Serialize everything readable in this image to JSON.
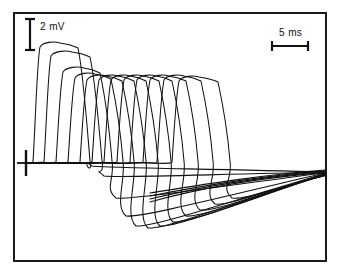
{
  "figure": {
    "type": "electrophysiology-trace-overlay",
    "background_color": "#ffffff",
    "trace_color": "#111111",
    "frame_color": "#1a1a1a"
  },
  "scale_bars": {
    "vertical": {
      "label": "2 mV",
      "value": 2,
      "unit": "mV",
      "pixel_length": 31,
      "x": 30,
      "y_top": 19,
      "y_bottom": 50
    },
    "horizontal": {
      "label": "5 ms",
      "value": 5,
      "unit": "ms",
      "pixel_length": 36,
      "y": 46,
      "x_left": 272,
      "x_right": 308
    }
  },
  "baseline_marker": {
    "name": "baseline-cross-marker",
    "x": 26,
    "y": 163,
    "h_half": 9,
    "v_half": 13
  },
  "chart_data": {
    "type": "line",
    "title": "",
    "xlabel": "",
    "ylabel": "",
    "grid": false,
    "legend": false,
    "x_unit": "ms",
    "y_unit": "mV",
    "baseline_y_px": 163,
    "x_axis_px": [
      26,
      325
    ],
    "y_axis_px": [
      14,
      260
    ],
    "px_per_ms": 7.2,
    "px_per_mV": 15.5,
    "n_traces": 12,
    "series": [
      {
        "name": "trace-1",
        "onset_px": 33,
        "peak_px": 43,
        "peak_x_px": 60,
        "plateau_end_px": 78,
        "fall_end_px": 163,
        "trough_px": 166,
        "trough_x_px": 92,
        "onset_ms": 0.97,
        "peak_mV": 7.74
      },
      {
        "name": "trace-2",
        "onset_px": 44,
        "peak_px": 52,
        "peak_x_px": 72,
        "plateau_end_px": 90,
        "fall_end_px": 163,
        "trough_px": 176,
        "trough_x_px": 104,
        "onset_ms": 2.5,
        "peak_mV": 7.16
      },
      {
        "name": "trace-3",
        "onset_px": 56,
        "peak_px": 68,
        "peak_x_px": 84,
        "plateau_end_px": 100,
        "fall_end_px": 163,
        "trough_px": 198,
        "trough_x_px": 116,
        "onset_ms": 4.17,
        "peak_mV": 6.13
      },
      {
        "name": "trace-4",
        "onset_px": 68,
        "peak_px": 74,
        "peak_x_px": 95,
        "plateau_end_px": 111,
        "fall_end_px": 163,
        "trough_px": 216,
        "trough_x_px": 126,
        "onset_ms": 5.83,
        "peak_mV": 5.74
      },
      {
        "name": "trace-5",
        "onset_px": 80,
        "peak_px": 76,
        "peak_x_px": 106,
        "plateau_end_px": 122,
        "fall_end_px": 163,
        "trough_px": 226,
        "trough_x_px": 136,
        "onset_ms": 7.5,
        "peak_mV": 5.61
      },
      {
        "name": "trace-6",
        "onset_px": 92,
        "peak_px": 76,
        "peak_x_px": 118,
        "plateau_end_px": 134,
        "fall_end_px": 163,
        "trough_px": 228,
        "trough_x_px": 148,
        "onset_ms": 9.17,
        "peak_mV": 5.61
      },
      {
        "name": "trace-7",
        "onset_px": 104,
        "peak_px": 76,
        "peak_x_px": 130,
        "plateau_end_px": 146,
        "fall_end_px": 163,
        "trough_px": 226,
        "trough_x_px": 160,
        "onset_ms": 10.83,
        "peak_mV": 5.61
      },
      {
        "name": "trace-8",
        "onset_px": 117,
        "peak_px": 76,
        "peak_x_px": 143,
        "plateau_end_px": 159,
        "fall_end_px": 163,
        "trough_px": 222,
        "trough_x_px": 173,
        "onset_ms": 12.64,
        "peak_mV": 5.61
      },
      {
        "name": "trace-9",
        "onset_px": 130,
        "peak_px": 76,
        "peak_x_px": 156,
        "plateau_end_px": 172,
        "fall_end_px": 163,
        "trough_px": 216,
        "trough_x_px": 186,
        "onset_ms": 14.44,
        "peak_mV": 5.61
      },
      {
        "name": "trace-10",
        "onset_px": 143,
        "peak_px": 76,
        "peak_x_px": 169,
        "plateau_end_px": 186,
        "fall_end_px": 163,
        "trough_px": 210,
        "trough_x_px": 200,
        "onset_ms": 16.25,
        "peak_mV": 5.61
      },
      {
        "name": "trace-11",
        "onset_px": 157,
        "peak_px": 76,
        "peak_x_px": 184,
        "plateau_end_px": 201,
        "fall_end_px": 163,
        "trough_px": 204,
        "trough_x_px": 215,
        "onset_ms": 18.19,
        "peak_mV": 5.61
      },
      {
        "name": "trace-12",
        "onset_px": 172,
        "peak_px": 77,
        "peak_x_px": 199,
        "plateau_end_px": 218,
        "fall_end_px": 163,
        "trough_px": 198,
        "trough_x_px": 232,
        "onset_ms": 20.28,
        "peak_mV": 5.55
      }
    ],
    "recovery_tail": {
      "description": "Slow afterhyperpolarization recovery converging toward baseline at right edge",
      "start_x_px": 150,
      "end_x_px": 325,
      "end_y_px": 172
    }
  }
}
